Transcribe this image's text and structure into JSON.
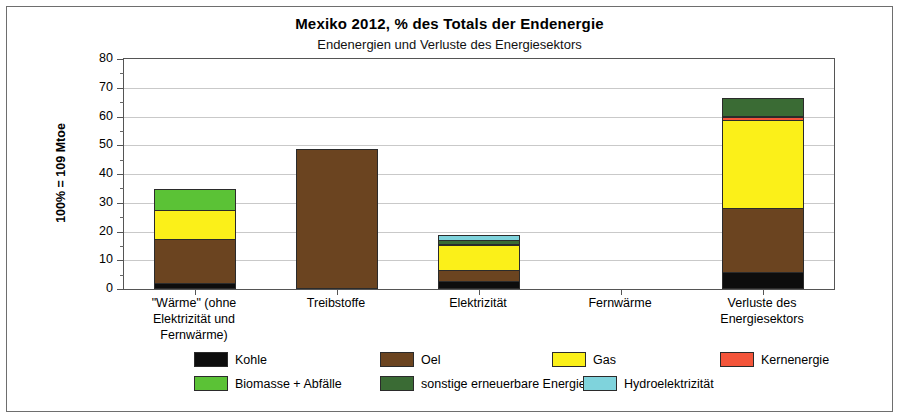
{
  "chart_data": {
    "type": "bar",
    "stacked": true,
    "title": "Mexiko  2012, % des Totals der Endenergie",
    "subtitle": "Endenergien und Verluste des Energiesektors",
    "xlabel": "",
    "ylabel": "100% = 109 Mtoe",
    "ylim": [
      0,
      80
    ],
    "ytick_labels": [
      "0",
      "10",
      "20",
      "30",
      "40",
      "50",
      "60",
      "70",
      "80"
    ],
    "ytick_values": [
      0,
      10,
      20,
      30,
      40,
      50,
      60,
      70,
      80
    ],
    "minor_tick_step": 5,
    "grid": true,
    "legend_position": "bottom",
    "categories": [
      "\"Wärme\" (ohne Elektrizität und Fernwärme)",
      "Treibstoffe",
      "Elektrizität",
      "Fernwärme",
      "Verluste des Energiesektors"
    ],
    "category_lines": [
      [
        "\"Wärme\" (ohne",
        "Elektrizität und",
        "Fernwärme)"
      ],
      [
        "Treibstoffe"
      ],
      [
        "Elektrizität"
      ],
      [
        "Fernwärme"
      ],
      [
        "Verluste des",
        "Energiesektors"
      ]
    ],
    "series": [
      {
        "name": "Kohle",
        "color": "#0d0d0d",
        "values": [
          1.7,
          0.0,
          2.5,
          0.0,
          5.5
        ]
      },
      {
        "name": "Oel",
        "color": "#6b4420",
        "values": [
          15.3,
          48.2,
          3.6,
          0.0,
          22.4
        ]
      },
      {
        "name": "Gas",
        "color": "#fbf019",
        "values": [
          10.3,
          0.0,
          8.9,
          0.0,
          30.6
        ]
      },
      {
        "name": "Kernenergie",
        "color": "#f4553a",
        "values": [
          0.0,
          0.0,
          0.0,
          0.0,
          1.0
        ]
      },
      {
        "name": "Biomasse + Abfälle",
        "color": "#5bc236",
        "values": [
          7.0,
          0.0,
          0.3,
          0.0,
          0.5
        ]
      },
      {
        "name": "sonstige erneuerbare Energie",
        "color": "#3a6b34",
        "values": [
          0.0,
          0.0,
          1.5,
          0.0,
          6.0
        ]
      },
      {
        "name": "Hydroelektrizität",
        "color": "#7fd3dc",
        "values": [
          0.0,
          0.0,
          1.7,
          0.0,
          0.0
        ]
      }
    ],
    "totals": [
      34.3,
      48.2,
      18.5,
      0.0,
      66.0
    ]
  },
  "legend": {
    "row1": [
      {
        "label": "Kohle",
        "color": "#0d0d0d"
      },
      {
        "label": "Oel",
        "color": "#6b4420"
      },
      {
        "label": "Gas",
        "color": "#fbf019"
      },
      {
        "label": "Kernenergie",
        "color": "#f4553a"
      }
    ],
    "row2": [
      {
        "label": "Biomasse + Abfälle",
        "color": "#5bc236"
      },
      {
        "label": "sonstige erneuerbare Energie",
        "color": "#3a6b34"
      },
      {
        "label": "Hydroelektrizität",
        "color": "#7fd3dc"
      }
    ]
  }
}
